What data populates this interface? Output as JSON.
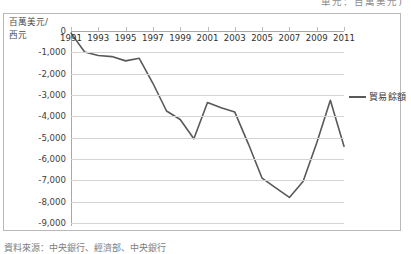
{
  "top_note": "單元：百萬美元)",
  "bottom_caption": "資料來源：中央銀行、經濟部、中央銀行",
  "axis_title": {
    "line1": "百萬美元/",
    "line2": "西元"
  },
  "legend": {
    "label": "貿易餘額",
    "color": "#595959",
    "position": "right"
  },
  "colors": {
    "series": "#595959",
    "gridline": "#d4d4d4",
    "axis": "#a8a8a8",
    "frame": "#b9b9b9",
    "background": "#ffffff",
    "text": "#2f2f2f"
  },
  "chart_data": {
    "type": "line",
    "title": "",
    "subtitle": "",
    "xlabel": "西元",
    "ylabel": "百萬美元",
    "xlim": [
      1991,
      2011
    ],
    "ylim": [
      -9000,
      0
    ],
    "grid": true,
    "legend_position": "right",
    "ytick_labels": [
      "0",
      "-1,000",
      "-2,000",
      "-3,000",
      "-4,000",
      "-5,000",
      "-6,000",
      "-7,000",
      "-8,000",
      "-9,000"
    ],
    "ytick_values": [
      0,
      -1000,
      -2000,
      -3000,
      -4000,
      -5000,
      -6000,
      -7000,
      -8000,
      -9000
    ],
    "xtick_labels": [
      "1991",
      "1993",
      "1995",
      "1997",
      "1999",
      "2001",
      "2003",
      "2005",
      "2007",
      "2009",
      "2011"
    ],
    "xtick_values": [
      1991,
      1993,
      1995,
      1997,
      1999,
      2001,
      2003,
      2005,
      2007,
      2009,
      2011
    ],
    "x": [
      1991,
      1992,
      1993,
      1994,
      1995,
      1996,
      1997,
      1998,
      1999,
      2000,
      2001,
      2002,
      2003,
      2004,
      2005,
      2006,
      2007,
      2008,
      2009,
      2010,
      2011
    ],
    "series": [
      {
        "name": "貿易餘額",
        "color": "#595959",
        "values": [
          -100,
          -980,
          -1150,
          -1200,
          -1400,
          -1280,
          -2450,
          -3750,
          -4150,
          -5050,
          -3350,
          -3600,
          -3800,
          -5300,
          -6900,
          -7350,
          -7800,
          -7050,
          -5250,
          -3250,
          -5400
        ]
      }
    ]
  }
}
